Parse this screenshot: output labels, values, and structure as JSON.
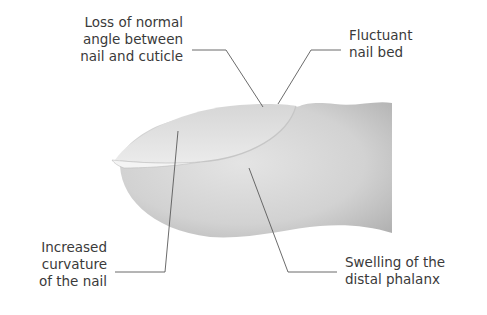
{
  "labels": {
    "angle": {
      "lines": [
        "Loss of normal",
        "angle between",
        "nail and cuticle"
      ]
    },
    "nail_bed": {
      "lines": [
        "Fluctuant",
        "nail bed"
      ]
    },
    "curvature": {
      "lines": [
        "Increased",
        "curvature",
        "of the nail"
      ]
    },
    "swelling": {
      "lines": [
        "Swelling of the",
        "distal phalanx"
      ]
    }
  },
  "colors": {
    "text": "#3a3a3a",
    "leader_line": "#555555",
    "skin_light": "#e2e2e2",
    "skin_dark": "#b4b4b4",
    "nail_light": "#ececec",
    "nail_edge": "#f6f6f6"
  }
}
